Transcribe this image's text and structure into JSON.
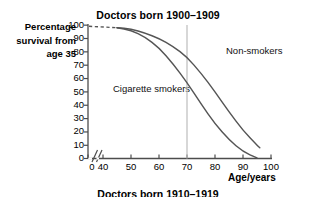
{
  "chart_data": {
    "type": "line",
    "title": "Doctors born 1900–1909",
    "xlabel": "Age/years",
    "ylabel": "Percentage survival from age 35",
    "ylabel_lines": [
      "Percentage",
      "survival from",
      "age 35"
    ],
    "xlim": [
      35,
      100
    ],
    "ylim": [
      0,
      100
    ],
    "axis_break": true,
    "axis_break_note": "0 then jump to 40",
    "grid": false,
    "legend_position": "inline-annotations",
    "xticks": [
      0,
      40,
      50,
      60,
      70,
      80,
      90,
      100
    ],
    "yticks": [
      0,
      10,
      20,
      30,
      40,
      50,
      60,
      70,
      80,
      90,
      100
    ],
    "reference_lines": [
      {
        "name": "age-70-marker",
        "x": 70,
        "color": "#b0b0b0"
      }
    ],
    "series": [
      {
        "name": "Non-smokers",
        "annotation": "Non-smokers",
        "color": "#555555",
        "x": [
          35,
          40,
          45,
          50,
          55,
          60,
          65,
          70,
          75,
          80,
          85,
          90,
          95,
          96
        ],
        "values": [
          99,
          98.5,
          98,
          97,
          94,
          90,
          84,
          76,
          64,
          50,
          35,
          21,
          10,
          8
        ],
        "dashed_to_x": 45
      },
      {
        "name": "Cigarette smokers",
        "annotation": "Cigarette smokers",
        "color": "#555555",
        "x": [
          35,
          40,
          45,
          50,
          55,
          60,
          65,
          70,
          75,
          80,
          85,
          90,
          95
        ],
        "values": [
          99,
          98.5,
          98,
          96,
          91,
          83,
          71,
          57,
          41,
          26,
          14,
          5,
          0.5
        ],
        "dashed_to_x": 45
      }
    ],
    "next_chart_title_partial": "Doctors born 1910–1919"
  },
  "annotations": {
    "non_smokers": "Non-smokers",
    "cigarette_smokers": "Cigarette smokers"
  },
  "axis": {
    "x_title": "Age/years",
    "y_title_lines": [
      "Percentage",
      "survival from",
      "age 35"
    ],
    "x_ticks": [
      "0",
      "40",
      "50",
      "60",
      "70",
      "80",
      "90",
      "100"
    ],
    "y_ticks": [
      "100",
      "90",
      "80",
      "70",
      "60",
      "50",
      "40",
      "30",
      "20",
      "10",
      "0"
    ]
  },
  "titles": {
    "main": "Doctors born 1900–1909",
    "next_partial": "Doctors born 1910–1919"
  },
  "colors": {
    "axis": "#4d4d4d",
    "curve": "#555555",
    "reference_line": "#b8b8b8",
    "text": "#000000"
  }
}
